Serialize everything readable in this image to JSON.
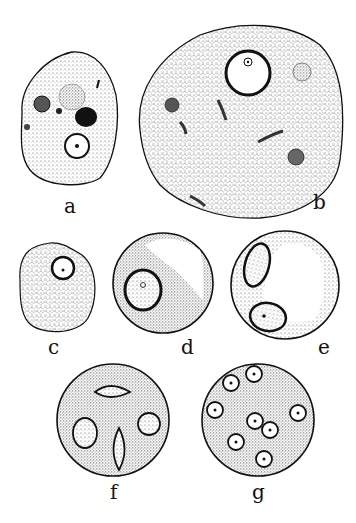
{
  "figure": {
    "panels": [
      {
        "id": "a",
        "label": "a",
        "name": "amoeba-with-vacuoles"
      },
      {
        "id": "b",
        "label": "b",
        "name": "large-amoeba-with-inclusions"
      },
      {
        "id": "c",
        "label": "c",
        "name": "rounded-cell-single-nucleus"
      },
      {
        "id": "d",
        "label": "d",
        "name": "cyst-with-nucleus-and-vacuole"
      },
      {
        "id": "e",
        "label": "e",
        "name": "cyst-with-two-nuclei"
      },
      {
        "id": "f",
        "label": "f",
        "name": "cyst-with-four-nuclei-dividing"
      },
      {
        "id": "g",
        "label": "g",
        "name": "cyst-with-eight-nuclei"
      }
    ],
    "colors": {
      "ink": "#111111",
      "stipple": "#8a8a8a",
      "paper": "#ffffff"
    }
  }
}
